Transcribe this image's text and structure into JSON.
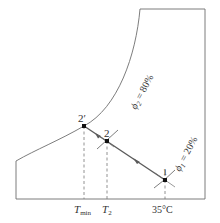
{
  "diagram": {
    "type": "psychrometric-process",
    "colors": {
      "line": "#6e6e6e",
      "process": "#5a5a5a",
      "point": "#111111",
      "text": "#333333"
    },
    "points": [
      {
        "id": "2prime",
        "label": "2′",
        "x": 84,
        "y": 126
      },
      {
        "id": "2",
        "label": "2",
        "x": 107,
        "y": 141
      },
      {
        "id": "1",
        "label": "1",
        "x": 165,
        "y": 180
      }
    ],
    "curves": [
      {
        "id": "phi2",
        "label_main": "ϕ",
        "label_sub": "2",
        "label_rest": " = 80%"
      },
      {
        "id": "phi1",
        "label_main": "ϕ",
        "label_sub": "1",
        "label_rest": " = 20%"
      }
    ],
    "axis_labels": {
      "tmin_main": "T",
      "tmin_sub": "min",
      "t2_main": "T",
      "t2_sub": "2",
      "t35": "35°C"
    }
  }
}
